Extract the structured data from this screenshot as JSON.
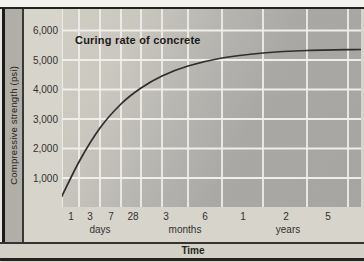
{
  "figure": {
    "title": "Curing rate of concrete",
    "y_axis_title": "Compressive strength (psi)",
    "x_axis_title": "Time"
  },
  "colors": {
    "outer_bg": "#d7d4cc",
    "top_strip": "#f3f1ec",
    "plot_bg_light": "#d1cec6",
    "plot_bg_dark": "#a6a5a2",
    "gridline": "#efeeea",
    "curve": "#2f2e2c",
    "frame": "#22211e",
    "side_band": "#b1aea8",
    "text": "#2f2d2a"
  },
  "chart_data": {
    "type": "line",
    "title": "Curing rate of concrete",
    "xlabel": "Time",
    "ylabel": "Compressive strength (psi)",
    "x_scale": "pseudo-logarithmic time (days / months / years)",
    "ylim": [
      0,
      6700
    ],
    "grid": "on (white gridlines)",
    "legend": "none",
    "y_tick_labels": [
      "6,000",
      "5,000",
      "4,000",
      "3,000",
      "2,000",
      "1,000"
    ],
    "y_ticks_psi": [
      6000,
      5000,
      4000,
      3000,
      2000,
      1000
    ],
    "x_tick_groups": [
      {
        "unit": "days",
        "ticks": [
          "1",
          "3",
          "7",
          "28"
        ]
      },
      {
        "unit": "months",
        "ticks": [
          "3",
          "6"
        ]
      },
      {
        "unit": "years",
        "ticks": [
          "1",
          "2",
          "5"
        ]
      }
    ],
    "series": [
      {
        "name": "Compressive strength over curing time",
        "points": [
          {
            "time": "1 day",
            "psi": 400
          },
          {
            "time": "3 days",
            "psi": 1600
          },
          {
            "time": "7 days",
            "psi": 2700
          },
          {
            "time": "28 days",
            "psi": 3900
          },
          {
            "time": "3 months",
            "psi": 4500
          },
          {
            "time": "6 months",
            "psi": 4900
          },
          {
            "time": "1 year",
            "psi": 5100
          },
          {
            "time": "2 years",
            "psi": 5250
          },
          {
            "time": "5 years",
            "psi": 5350
          }
        ]
      }
    ],
    "render": {
      "plot": {
        "left": 62,
        "top": 9,
        "width": 299,
        "height": 198
      },
      "y_scale": {
        "baseline_px": 198.5,
        "px_per_1000_psi": 29.5
      },
      "v_gridlines_x": [
        0,
        17,
        38,
        59,
        79,
        100,
        126,
        160,
        201,
        245,
        286
      ],
      "x_ticks_px": [
        {
          "label": "1",
          "x": 9
        },
        {
          "label": "3",
          "x": 28
        },
        {
          "label": "7",
          "x": 49
        },
        {
          "label": "28",
          "x": 71
        },
        {
          "label": "3",
          "x": 104
        },
        {
          "label": "6",
          "x": 143
        },
        {
          "label": "1",
          "x": 181
        },
        {
          "label": "2",
          "x": 224
        },
        {
          "label": "5",
          "x": 266
        }
      ],
      "x_units_px": [
        {
          "label": "days",
          "x": 38
        },
        {
          "label": "months",
          "x": 123
        },
        {
          "label": "years",
          "x": 226
        }
      ],
      "curve_px": [
        [
          0,
          187
        ],
        [
          18,
          151
        ],
        [
          38,
          119
        ],
        [
          59,
          95
        ],
        [
          79,
          79
        ],
        [
          100,
          67
        ],
        [
          126,
          57
        ],
        [
          160,
          49
        ],
        [
          201,
          44
        ],
        [
          245,
          41.5
        ],
        [
          299,
          40.5
        ]
      ]
    }
  }
}
